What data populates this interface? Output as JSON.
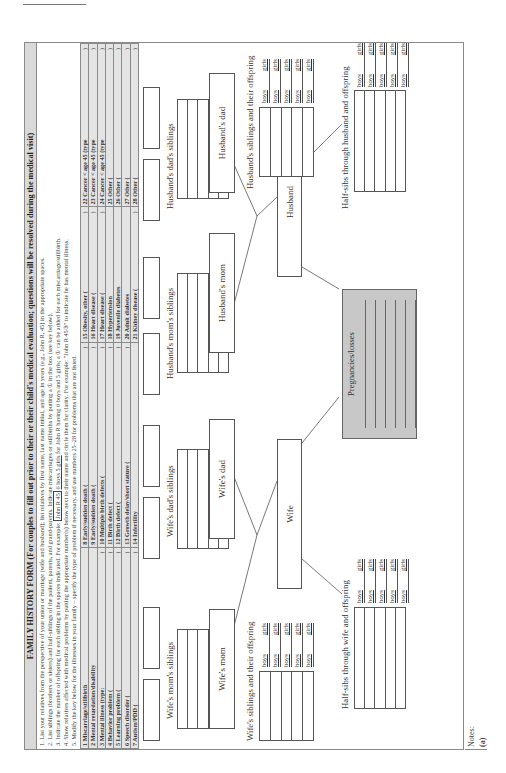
{
  "form": {
    "title": "FAMILY HISTORY FORM (For couples to fill out prior to their or their child's medical evaluation; questions will be resolved during the medical visit)",
    "instructions": [
      "1. List your relatives from the perspective of your union or marriage (wife and husband); list relatives by first name, last name initial, and age in years (e.g., John R, 45) in the appropriate spaces.",
      "2. List siblings (brothers or sisters) and half-siblings of the patient, parents, and grand-parents. Indicate miscarriages or stillbirths by putting a ① in the box (see key below).",
      "4. Show relatives affected with medical problems by putting the appropriate number(s) below next to their name and circle them for clarity. For example: \"John R 45③\" to indicate he has mental illness.",
      "5. Modify the key below for the illnesses in your family – specify the type of problem if necessary, and use numbers 25–28 for problems that are not listed."
    ],
    "instruction3": {
      "before": "3. Indicate the number of offspring for each sibling in the spaces indicated. For example: ",
      "example_box": "John R 45",
      "example_underline": "6 boys 5 girls",
      "after": " for John R having 6 boys and 5 girls; a ① can be added for each miscarriage/stillbirth."
    }
  },
  "key": {
    "rows": [
      [
        "1 Miscarriage/stillbirth",
        "8 Early/sudden death (",
        "15 Obesity, other (",
        "22 Cancer < age 45 (type"
      ],
      [
        "2 Mental retardation/disability",
        "9 Early/sudden death (",
        "16 Heart disease (",
        "23 Cancer < age 45 (type"
      ],
      [
        "3 Mental illness (type:",
        "10 Multiple birth defects (",
        "17 Heart disease (",
        "24 Cancer < age 45 (type"
      ],
      [
        "4 Behavior problem (",
        "11 Birth defect (",
        "18 Hypertension",
        "25 Other ("
      ],
      [
        "5 Learning problem (",
        "12 Birth defect (",
        "19 Juvenile diabetes",
        "26 Other ("
      ],
      [
        "6 Speech disorder (",
        "13 Growth delay/short stature (",
        "20 Adult diabetes",
        "27 Other ("
      ],
      [
        "7 Autism/PDD (",
        "14 Infertility",
        "21 Kidney disease (",
        "28 Other ("
      ]
    ],
    "close_paren": ")"
  },
  "diagram": {
    "wife_moms_siblings": "Wife's mom's siblings",
    "wife_dads_siblings": "Wife's dad's siblings",
    "husband_moms_siblings": "Husband's mom's siblings",
    "husband_dads_siblings": "Husband's dad's siblings",
    "wife_mom": "Wife's mom",
    "wife_dad": "Wife's dad",
    "husband_mom": "Husband's mom",
    "husband_dad": "Husband's dad",
    "wife": "Wife",
    "husband": "Husband",
    "wife_siblings": "Wife's siblings and their offspring",
    "husband_siblings": "Husband's siblings and their offspring",
    "half_sibs_wife": "Half-sibs through wife and offspring",
    "half_sibs_husband": "Half-sibs through husband and offspring",
    "pregnancies": "Pregnancies/losses",
    "boys": "boys",
    "girls": "girls"
  },
  "notes": {
    "label": "Notes:",
    "caption": "(a)"
  }
}
